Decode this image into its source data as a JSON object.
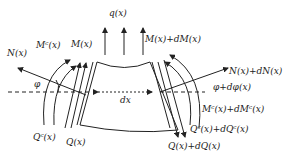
{
  "diagram": {
    "labels": {
      "q": "q(x)",
      "N_left": "N(x)",
      "Mc_left": "Mᶜ(x)",
      "M_left": "M(x)",
      "M_right": "M(x)+dM(x)",
      "N_right": "N(x)+dN(x)",
      "phi_left": "φ",
      "dx": "dx",
      "phi_right": "φ+dφ(x)",
      "Mc_right": "Mᶜ(x)+dMᶜ(x)",
      "Qc_left": "Qᶜ(x)",
      "Q_left": "Q(x)",
      "Qc_right": "Qᶜ(x)+dQᶜ(x)",
      "Q_right": "Q(x)+dQ(x)"
    },
    "colors": {
      "stroke": "#222222",
      "background": "#ffffff"
    }
  }
}
